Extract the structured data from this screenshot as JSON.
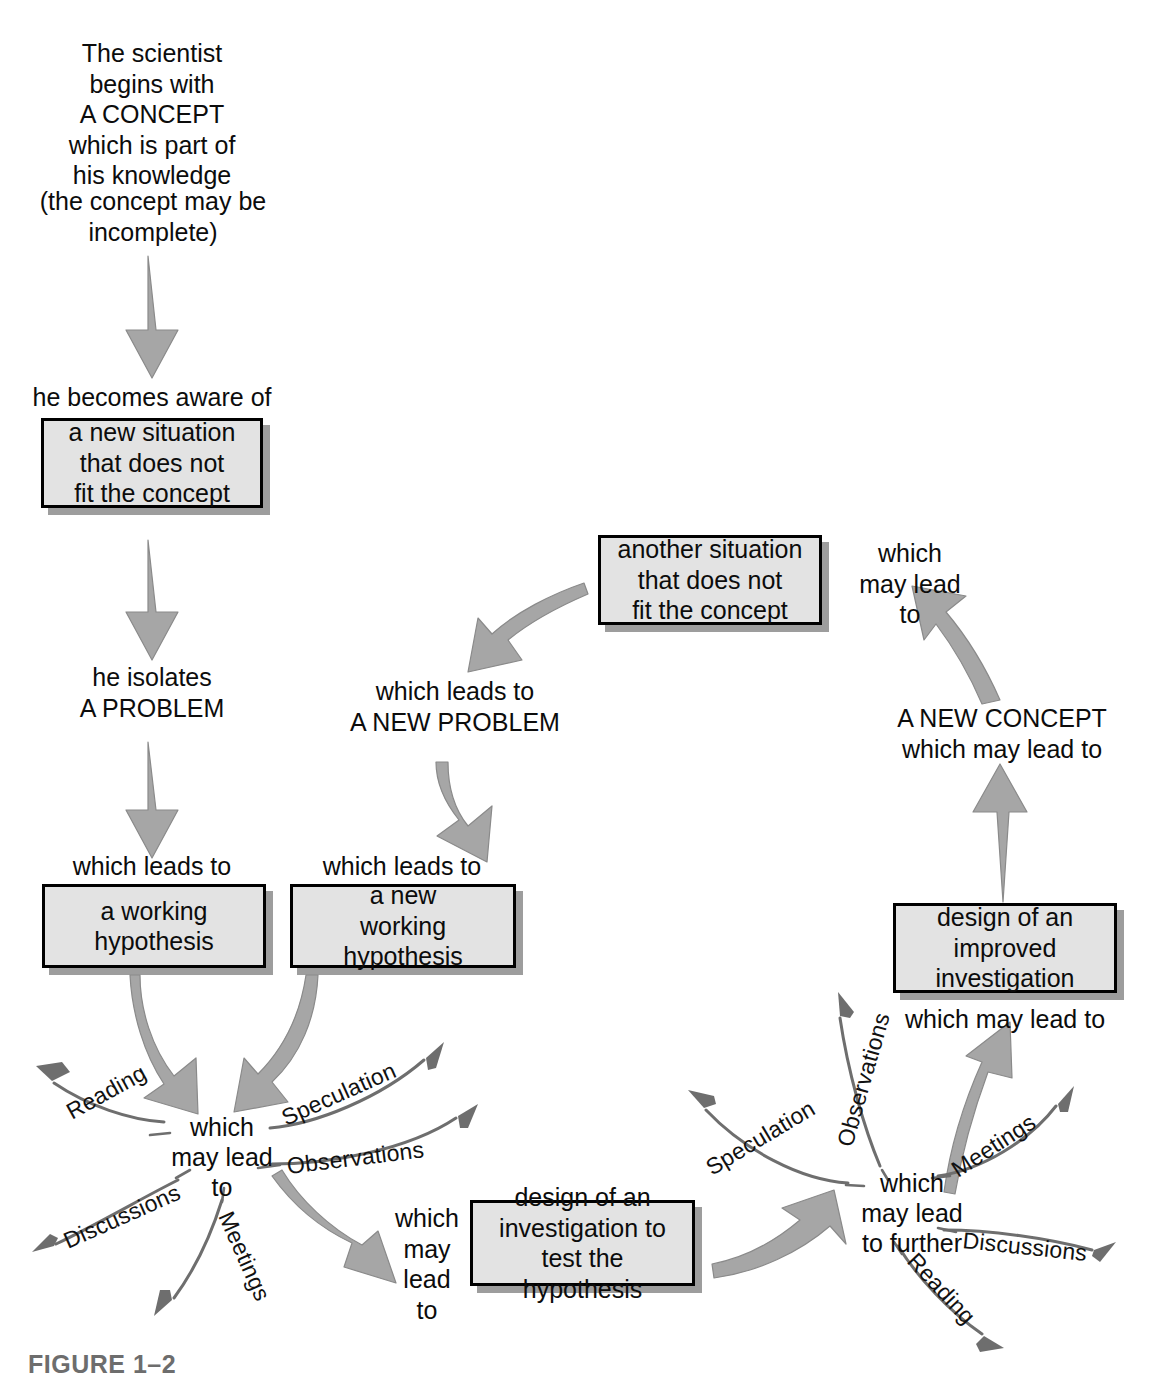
{
  "figure": {
    "caption": "FIGURE 1–2"
  },
  "colors": {
    "box_fill": "#e3e3e3",
    "box_border": "#000000",
    "box_shadow": "#8c8c8c",
    "fat_arrow_fill": "#a6a6a6",
    "fat_arrow_stroke": "#8a8a8a",
    "thin_arrow": "#6e6e6e",
    "text": "#0c0c0c",
    "caption_text": "#6d6d6d",
    "background": "#ffffff"
  },
  "nodes": {
    "start_text": "The scientist\nbegins with\nA CONCEPT\nwhich is part of\nhis knowledge",
    "start_note": "(the concept may be\nincomplete)",
    "aware_label": "he becomes aware of",
    "new_situation_box": "a new situation\nthat does not\nfit the concept",
    "isolates_problem": "he isolates\nA PROBLEM",
    "which_leads_to_1": "which leads to",
    "working_hypothesis_box": "a working\nhypothesis",
    "which_leads_to_2": "which leads to",
    "new_working_hypothesis_box": "a new\nworking\nhypothesis",
    "which_leads_to_new_problem": "which leads to\nA NEW PROBLEM",
    "another_situation_box": "another situation\nthat does not\nfit the concept",
    "which_may_lead_to_right_top": "which\nmay lead\nto",
    "new_concept_label": "A NEW CONCEPT\nwhich may lead to",
    "improved_investigation_box": "design of an\nimproved\ninvestigation",
    "which_may_lead_to_under_improved": "which may lead to",
    "which_may_lead_to_investigation": "which\nmay lead\nto",
    "investigation_box": "design of an\ninvestigation to\ntest the hypothesis"
  },
  "hubs": {
    "left": {
      "text": "which\nmay lead\nto",
      "spokes": [
        {
          "label": "Reading",
          "direction": "upper-left"
        },
        {
          "label": "Speculation",
          "direction": "upper-right"
        },
        {
          "label": "Observations",
          "direction": "right"
        },
        {
          "label": "Discussions",
          "direction": "lower-left"
        },
        {
          "label": "Meetings",
          "direction": "down"
        }
      ]
    },
    "right": {
      "text": "which\nmay lead\nto further",
      "spokes": [
        {
          "label": "Speculation",
          "direction": "upper-left"
        },
        {
          "label": "Observations",
          "direction": "up"
        },
        {
          "label": "Meetings",
          "direction": "upper-right"
        },
        {
          "label": "Discussions",
          "direction": "right"
        },
        {
          "label": "Reading",
          "direction": "lower-right"
        }
      ]
    }
  },
  "flow_edges": [
    {
      "from": "A CONCEPT",
      "to": "he becomes aware of",
      "style": "fat-straight-down"
    },
    {
      "from": "a new situation that does not fit the concept",
      "to": "he isolates A PROBLEM",
      "style": "fat-straight-down"
    },
    {
      "from": "he isolates A PROBLEM",
      "to": "a working hypothesis",
      "style": "fat-straight-down"
    },
    {
      "from": "a working hypothesis",
      "to": "left hub",
      "style": "fat-curved"
    },
    {
      "from": "a new working hypothesis",
      "to": "left hub",
      "style": "fat-curved"
    },
    {
      "from": "left hub",
      "to": "design of an investigation to test the hypothesis",
      "style": "fat-curved"
    },
    {
      "from": "design of an investigation to test the hypothesis",
      "to": "right hub",
      "style": "fat-curved"
    },
    {
      "from": "right hub",
      "to": "design of an improved investigation",
      "style": "fat-curved"
    },
    {
      "from": "design of an improved investigation",
      "to": "A NEW CONCEPT",
      "style": "fat-straight-up"
    },
    {
      "from": "A NEW CONCEPT",
      "to": "another situation that does not fit the concept",
      "style": "fat-curved-up"
    },
    {
      "from": "another situation that does not fit the concept",
      "to": "A NEW PROBLEM",
      "style": "fat-curved-down-left"
    },
    {
      "from": "A NEW PROBLEM",
      "to": "a new working hypothesis",
      "style": "fat-curved-down"
    }
  ]
}
